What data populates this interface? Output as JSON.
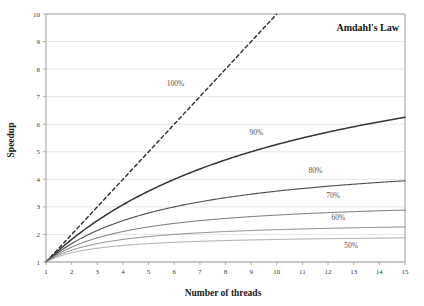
{
  "chart_data": {
    "type": "line",
    "title": "Amdahl's Law",
    "xlabel": "Number of threads",
    "ylabel": "Speedup",
    "xlim": [
      1,
      15
    ],
    "ylim": [
      1,
      10
    ],
    "grid": true,
    "legend_position": "inline-annotations",
    "xticks": [
      "1",
      "2",
      "3",
      "4",
      "5",
      "6",
      "7",
      "8",
      "9",
      "10",
      "11",
      "12",
      "13",
      "14",
      "15"
    ],
    "yticks": [
      "1",
      "2",
      "3",
      "4",
      "5",
      "6",
      "7",
      "8",
      "9",
      "10"
    ],
    "x": [
      1,
      2,
      3,
      4,
      5,
      6,
      7,
      8,
      9,
      10,
      11,
      12,
      13,
      14,
      15
    ],
    "series": [
      {
        "name": "100%",
        "label": "100%",
        "parallel_fraction": 1.0,
        "style": "dashed",
        "color": "#2b2b2b",
        "width": 1.4,
        "clip_at_y": 10,
        "values": [
          1,
          2,
          3,
          4,
          5,
          6,
          7,
          8,
          9,
          10,
          11,
          12,
          13,
          14,
          15
        ],
        "label_x": 6.05,
        "label_y": 7.4
      },
      {
        "name": "90%",
        "label": "90%",
        "parallel_fraction": 0.9,
        "style": "solid",
        "color": "#333333",
        "width": 1.5,
        "values": [
          1,
          1.82,
          2.5,
          3.08,
          3.57,
          4,
          4.38,
          4.71,
          5,
          5.26,
          5.5,
          5.71,
          5.91,
          6.09,
          6.25
        ],
        "label_x": 9.2,
        "label_y": 5.62
      },
      {
        "name": "80%",
        "label": "80%",
        "parallel_fraction": 0.8,
        "style": "solid",
        "color": "#4d4d4d",
        "width": 1.1,
        "values": [
          1,
          1.67,
          2.14,
          2.5,
          2.78,
          3,
          3.18,
          3.33,
          3.47,
          3.57,
          3.67,
          3.75,
          3.82,
          3.89,
          3.95
        ],
        "label_x": 11.5,
        "label_y": 4.22
      },
      {
        "name": "70%",
        "label": "70%",
        "parallel_fraction": 0.7,
        "style": "solid",
        "color": "#676767",
        "width": 0.95,
        "values": [
          1,
          1.54,
          1.88,
          2.11,
          2.27,
          2.4,
          2.5,
          2.58,
          2.65,
          2.7,
          2.75,
          2.79,
          2.83,
          2.86,
          2.88
        ],
        "label_x": 12.2,
        "label_y": 3.32
      },
      {
        "name": "60%",
        "label": "60%",
        "parallel_fraction": 0.6,
        "style": "solid",
        "color": "#7e7e7e",
        "width": 0.9,
        "values": [
          1,
          1.43,
          1.67,
          1.82,
          1.92,
          2,
          2.06,
          2.11,
          2.14,
          2.17,
          2.2,
          2.22,
          2.24,
          2.26,
          2.27
        ],
        "label_x": 12.4,
        "label_y": 2.52
      },
      {
        "name": "50%",
        "label": "50%",
        "parallel_fraction": 0.5,
        "style": "solid",
        "color": "#9a9a9a",
        "width": 0.85,
        "values": [
          1,
          1.33,
          1.5,
          1.6,
          1.67,
          1.71,
          1.75,
          1.78,
          1.8,
          1.82,
          1.83,
          1.85,
          1.86,
          1.87,
          1.88
        ],
        "label_x": 12.9,
        "label_y": 1.52
      }
    ],
    "colors": {
      "grid": "#e3e3e3",
      "axis": "#9d9d9d",
      "text": "#3a3a3a",
      "title": "#111111",
      "background": "#ffffff"
    }
  }
}
